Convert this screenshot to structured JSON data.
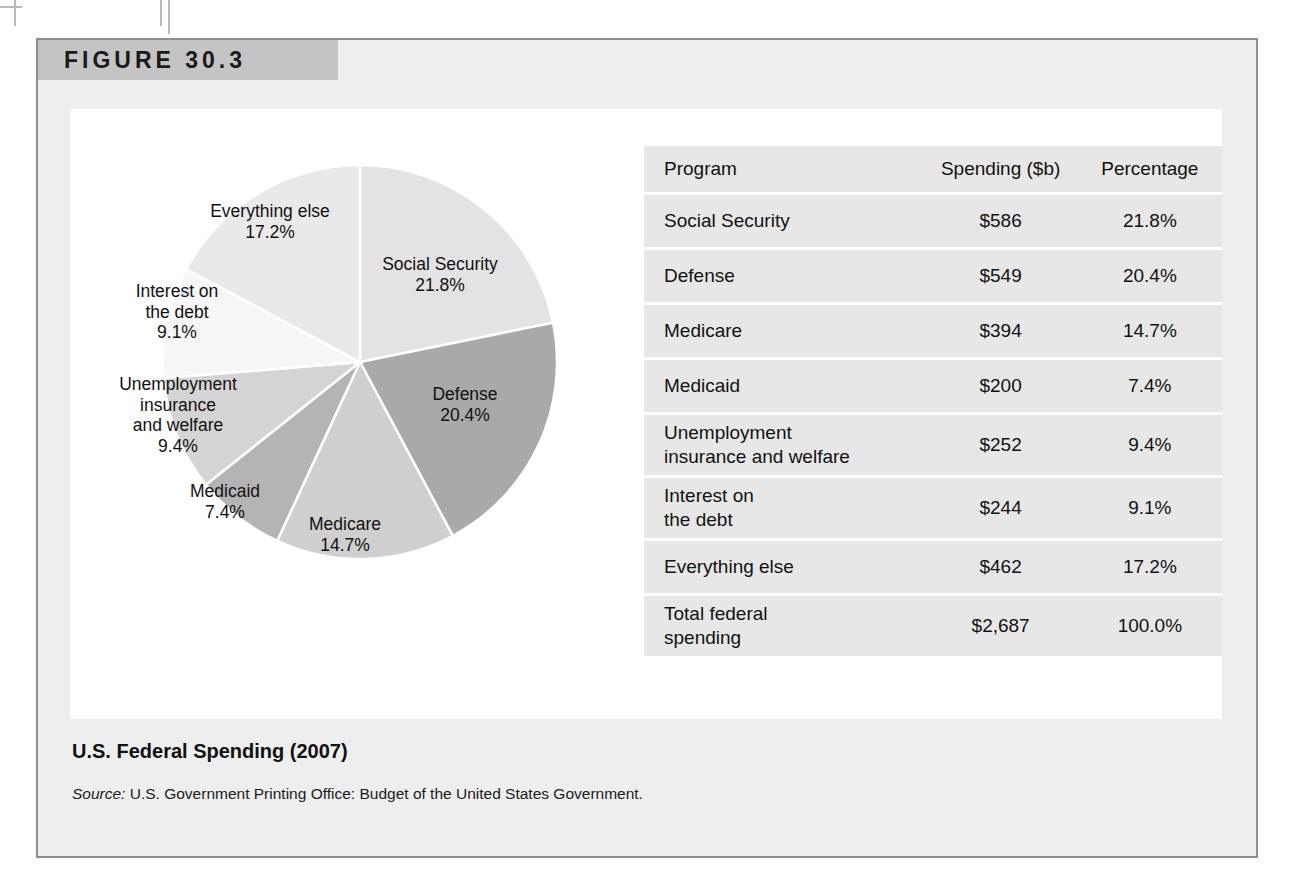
{
  "figure": {
    "number_label": "FIGURE 30.3",
    "caption": "U.S. Federal Spending (2007)",
    "source_prefix": "Source:",
    "source_text": "U.S. Government Printing Office: Budget of the United States Government."
  },
  "table": {
    "headers": [
      "Program",
      "Spending ($b)",
      "Percentage"
    ],
    "rows": [
      {
        "program": "Social Security",
        "program_line2": "",
        "spending": "$586",
        "percentage": "21.8%"
      },
      {
        "program": "Defense",
        "program_line2": "",
        "spending": "$549",
        "percentage": "20.4%"
      },
      {
        "program": "Medicare",
        "program_line2": "",
        "spending": "$394",
        "percentage": "14.7%"
      },
      {
        "program": "Medicaid",
        "program_line2": "",
        "spending": "$200",
        "percentage": "7.4%"
      },
      {
        "program": "Unemployment",
        "program_line2": "insurance and welfare",
        "spending": "$252",
        "percentage": "9.4%"
      },
      {
        "program": "Interest on",
        "program_line2": "the debt",
        "spending": "$244",
        "percentage": "9.1%"
      },
      {
        "program": "Everything else",
        "program_line2": "",
        "spending": "$462",
        "percentage": "17.2%"
      },
      {
        "program": "Total federal",
        "program_line2": "spending",
        "spending": "$2,687",
        "percentage": "100.0%"
      }
    ]
  },
  "chart_data": {
    "type": "pie",
    "title": "U.S. Federal Spending (2007)",
    "xlabel": "",
    "ylabel": "",
    "units": "billions of U.S. dollars",
    "total_value": 2687,
    "total_label": "Total federal spending",
    "legend_position": "none-labels-on-slices",
    "start_angle_deg": 0,
    "direction": "clockwise",
    "categories": [
      "Social Security",
      "Defense",
      "Medicare",
      "Medicaid",
      "Unemployment insurance and welfare",
      "Interest on the debt",
      "Everything else"
    ],
    "values": [
      586,
      549,
      394,
      200,
      252,
      244,
      462
    ],
    "percentages": [
      21.8,
      20.4,
      14.7,
      7.4,
      9.4,
      9.1,
      17.2
    ],
    "colors": [
      "#e3e3e3",
      "#a9a9a9",
      "#cfcfcf",
      "#b4b4b4",
      "#d4d4d4",
      "#f6f6f6",
      "#e9e9e9"
    ],
    "slices": [
      {
        "label": "Social Security",
        "pct_label": "21.8%",
        "value": 586,
        "percentage": 21.8,
        "color": "#e3e3e3"
      },
      {
        "label": "Defense",
        "pct_label": "20.4%",
        "value": 549,
        "percentage": 20.4,
        "color": "#a9a9a9"
      },
      {
        "label": "Medicare",
        "pct_label": "14.7%",
        "value": 394,
        "percentage": 14.7,
        "color": "#cfcfcf"
      },
      {
        "label": "Medicaid",
        "pct_label": "7.4%",
        "value": 200,
        "percentage": 7.4,
        "color": "#b4b4b4"
      },
      {
        "label": "Unemployment insurance and welfare",
        "pct_label": "9.4%",
        "value": 252,
        "percentage": 9.4,
        "color": "#d4d4d4"
      },
      {
        "label": "Interest on the debt",
        "pct_label": "9.1%",
        "value": 244,
        "percentage": 9.1,
        "color": "#f6f6f6"
      },
      {
        "label": "Everything else",
        "pct_label": "17.2%",
        "value": 462,
        "percentage": 17.2,
        "color": "#e9e9e9"
      }
    ]
  },
  "pie_labels": [
    {
      "line1": "Social Security",
      "line2": "",
      "pct": "21.8%"
    },
    {
      "line1": "Defense",
      "line2": "",
      "pct": "20.4%"
    },
    {
      "line1": "Medicare",
      "line2": "",
      "pct": "14.7%"
    },
    {
      "line1": "Medicaid",
      "line2": "",
      "pct": "7.4%"
    },
    {
      "line1": "Unemployment",
      "line2": "insurance",
      "line3": "and welfare",
      "pct": "9.4%"
    },
    {
      "line1": "Interest on",
      "line2": "the debt",
      "pct": "9.1%"
    },
    {
      "line1": "Everything else",
      "line2": "",
      "pct": "17.2%"
    }
  ],
  "theme": {
    "panel_bg": "#eeeeee",
    "panel_border": "#8f8f8f",
    "header_band": "#c4c4c4",
    "plate_bg": "#ffffff",
    "row_bg": "#e7e7e7",
    "text": "#111111"
  }
}
